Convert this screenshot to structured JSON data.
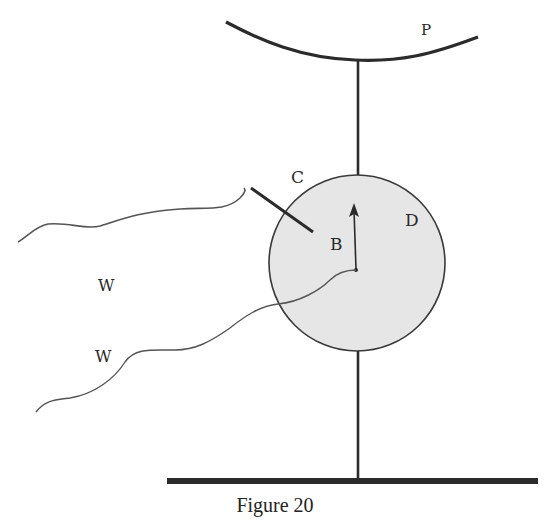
{
  "figure": {
    "caption": "Figure 20",
    "labels": {
      "p": "P",
      "c": "C",
      "b": "B",
      "d": "D",
      "w_upper": "W",
      "w_lower": "W"
    },
    "colors": {
      "line": "#2b2b2b",
      "sphere_fill": "#e6e6e6",
      "background": "#ffffff"
    },
    "elements": [
      "curved-plate-p",
      "vertical-rod",
      "sphere",
      "arrow",
      "center-dot",
      "pointer-c",
      "wire-upper",
      "wire-lower",
      "base-bar"
    ]
  }
}
